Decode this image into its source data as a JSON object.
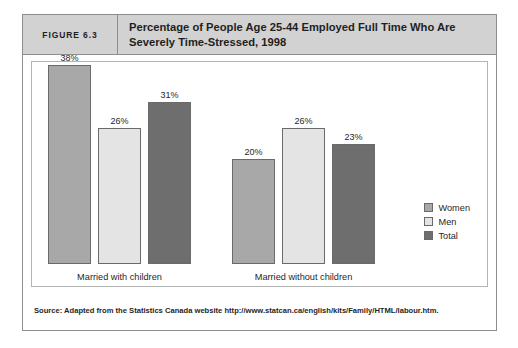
{
  "figure": {
    "number_label": "FIGURE 6.3",
    "title": "Percentage of People Age 25-44 Employed Full Time Who Are Severely Time-Stressed, 1998",
    "source": "Source: Adapted from the Statistics Canada website http://www.statcan.ca/english/kits/Family/HTML/labour.htm."
  },
  "legend": {
    "items": [
      {
        "label": "Women",
        "color": "#a8a8a8"
      },
      {
        "label": "Men",
        "color": "#e4e4e4"
      },
      {
        "label": "Total",
        "color": "#6e6e6e"
      }
    ]
  },
  "chart_data": {
    "type": "bar",
    "title": "Percentage of People Age 25-44 Employed Full Time Who Are Severely Time-Stressed, 1998",
    "xlabel": "",
    "ylabel": "",
    "ylim": [
      0,
      40
    ],
    "grid": false,
    "legend_position": "right",
    "categories": [
      "Married with children",
      "Married without children"
    ],
    "series": [
      {
        "name": "Women",
        "color": "#a8a8a8",
        "values": [
          38,
          20
        ],
        "labels": [
          "38%",
          "20%"
        ]
      },
      {
        "name": "Men",
        "color": "#e4e4e4",
        "values": [
          26,
          26
        ],
        "labels": [
          "26%",
          "26%"
        ]
      },
      {
        "name": "Total",
        "color": "#6e6e6e",
        "values": [
          31,
          23
        ],
        "labels": [
          "31%",
          "23%"
        ]
      }
    ]
  }
}
